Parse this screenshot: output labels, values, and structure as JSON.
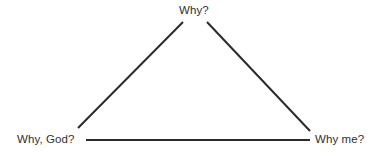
{
  "diagram": {
    "type": "open-triangle",
    "background_color": "#ffffff",
    "stroke_color": "#2b2b2b",
    "stroke_width": 2,
    "text_color": "#2f2f2f",
    "vertices": {
      "apex": {
        "label": "Why?",
        "position": "top-center"
      },
      "bottom_left": {
        "label": "Why, God?",
        "position": "bottom-left"
      },
      "bottom_right": {
        "label": "Why me?",
        "position": "bottom-right"
      }
    },
    "edges": [
      {
        "name": "left-edge",
        "from": "apex",
        "to": "bottom_left",
        "x1": 183,
        "y1": 22,
        "x2": 78,
        "y2": 128
      },
      {
        "name": "right-edge",
        "from": "apex",
        "to": "bottom_right",
        "x1": 207,
        "y1": 22,
        "x2": 310,
        "y2": 131
      },
      {
        "name": "bottom-edge",
        "from": "bottom_left",
        "to": "bottom_right",
        "x1": 86,
        "y1": 140,
        "x2": 310,
        "y2": 140
      }
    ]
  }
}
